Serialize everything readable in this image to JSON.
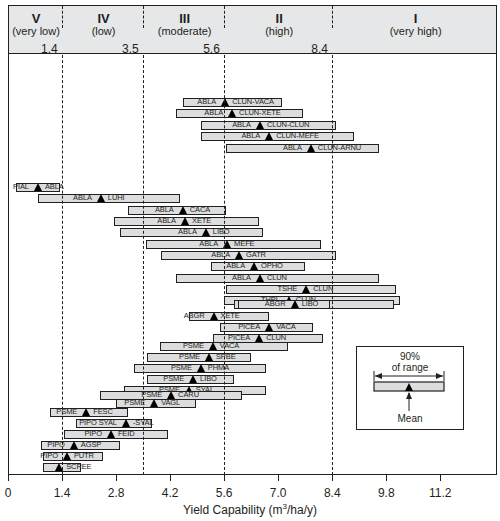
{
  "chart_data": {
    "type": "bar",
    "subtype": "floating-range-with-mean",
    "title": "",
    "xlabel": "Yield Capability (m³/ha/y)",
    "ylabel": "",
    "xlim": [
      0,
      12.6
    ],
    "x_ticks": [
      0,
      1.4,
      2.8,
      4.2,
      5.6,
      7.0,
      8.4,
      9.8,
      11.2
    ],
    "x_tick_labels": [
      "0",
      "1.4",
      "2.8",
      "4.2",
      "5.6",
      "7.0",
      "8.4",
      "9.8",
      "11.2"
    ],
    "grid": false,
    "class_boundaries": [
      1.4,
      3.5,
      5.6,
      8.4
    ],
    "classes": [
      {
        "numeral": "V",
        "label": "(very low)"
      },
      {
        "numeral": "IV",
        "label": "(low)"
      },
      {
        "numeral": "III",
        "label": "(moderate)"
      },
      {
        "numeral": "II",
        "label": "(high)"
      },
      {
        "numeral": "I",
        "label": "(very high)"
      }
    ],
    "boundary_labels": [
      "1.4",
      "3.5",
      "5.6",
      "8.4"
    ],
    "series": [
      {
        "left": "ABLA",
        "right": "CLUN-VACA",
        "start": 4.53,
        "mean": 5.6,
        "end": 7.1
      },
      {
        "left": "ABLA",
        "right": "CLUN-XETE",
        "start": 4.35,
        "mean": 5.78,
        "end": 7.65
      },
      {
        "left": "ABLA",
        "right": "CLUN-CLUN",
        "start": 5.0,
        "mean": 6.5,
        "end": 8.5
      },
      {
        "left": "ABLA",
        "right": "CLUN-MEFE",
        "start": 5.0,
        "mean": 6.74,
        "end": 8.96
      },
      {
        "left": "ABLA",
        "right": "CLUN-ARNU",
        "start": 5.65,
        "mean": 7.82,
        "end": 9.6
      },
      {
        "left": "PIAL",
        "right": "ABLA",
        "start": 0.2,
        "mean": 0.75,
        "end": 1.35
      },
      {
        "left": "ABLA",
        "right": "LUHI",
        "start": 0.78,
        "mean": 2.38,
        "end": 4.45
      },
      {
        "left": "ABLA",
        "right": "CACA",
        "start": 3.1,
        "mean": 4.5,
        "end": 5.65
      },
      {
        "left": "ABLA",
        "right": "XETE",
        "start": 2.75,
        "mean": 4.56,
        "end": 6.5
      },
      {
        "left": "ABLA",
        "right": "LIBO",
        "start": 2.9,
        "mean": 5.1,
        "end": 6.6
      },
      {
        "left": "ABLA",
        "right": "MEFE",
        "start": 3.58,
        "mean": 5.65,
        "end": 8.1
      },
      {
        "left": "ABLA",
        "right": "GATR",
        "start": 3.97,
        "mean": 5.96,
        "end": 8.5
      },
      {
        "left": "ABLA",
        "right": "OPHO",
        "start": 5.26,
        "mean": 6.35,
        "end": 7.7
      },
      {
        "left": "ABLA",
        "right": "CLUN",
        "start": 4.35,
        "mean": 6.5,
        "end": 9.6
      },
      {
        "left": "TSHE",
        "right": "CLUN",
        "start": 5.65,
        "mean": 7.7,
        "end": 10.05
      },
      {
        "left": "THPL",
        "right": "CLUN",
        "start": 5.6,
        "mean": 7.25,
        "end": 10.15
      },
      {
        "left": "ABGR",
        "right": "CLUN",
        "start": 5.85,
        "mean": 7.5,
        "end": 10.0
      },
      {
        "left": "ABGR",
        "right": "LIBO",
        "start": 5.95,
        "mean": 7.4,
        "end": 8.35
      },
      {
        "left": "ABGR",
        "right": "XETE",
        "start": 4.7,
        "mean": 5.3,
        "end": 6.75
      },
      {
        "left": "PICEA",
        "right": "VACA",
        "start": 5.5,
        "mean": 6.74,
        "end": 7.9
      },
      {
        "left": "PICEA",
        "right": "CLUN",
        "start": 5.3,
        "mean": 6.48,
        "end": 8.15
      },
      {
        "left": "PSME",
        "right": "VACA",
        "start": 3.94,
        "mean": 5.28,
        "end": 7.25
      },
      {
        "left": "PSME",
        "right": "SPBE",
        "start": 3.6,
        "mean": 5.18,
        "end": 6.3
      },
      {
        "left": "PSME",
        "right": "PHMA",
        "start": 3.26,
        "mean": 4.97,
        "end": 6.68
      },
      {
        "left": "PSME",
        "right": "LIBO",
        "start": 3.6,
        "mean": 4.77,
        "end": 5.85
      },
      {
        "left": "PSME",
        "right": "SYAL",
        "start": 3.0,
        "mean": 4.66,
        "end": 6.68
      },
      {
        "left": "PSME",
        "right": "CARU",
        "start": 2.38,
        "mean": 4.2,
        "end": 6.06
      },
      {
        "left": "PSME",
        "right": "VAGL",
        "start": 2.8,
        "mean": 3.76,
        "end": 4.87
      },
      {
        "left": "PSME",
        "right": "FESC",
        "start": 1.1,
        "mean": 2.0,
        "end": 3.1
      },
      {
        "left": "PIPO SYAL",
        "right": "-SYAL",
        "start": 1.76,
        "mean": 3.03,
        "end": 3.73
      },
      {
        "left": "PIPO",
        "right": "FEID",
        "start": 1.45,
        "mean": 2.64,
        "end": 4.15
      },
      {
        "left": "PIPO",
        "right": "AGSP",
        "start": 0.85,
        "mean": 1.68,
        "end": 2.9
      },
      {
        "left": "PIPO",
        "right": "PUTR",
        "start": 0.9,
        "mean": 1.5,
        "end": 2.46
      },
      {
        "left": "",
        "right": "SCREE",
        "start": 0.9,
        "mean": 1.3,
        "end": 1.9
      }
    ],
    "legend": {
      "range_label_line1": "90%",
      "range_label_line2": "of range",
      "mean_label": "Mean",
      "position": "lower-right"
    }
  }
}
